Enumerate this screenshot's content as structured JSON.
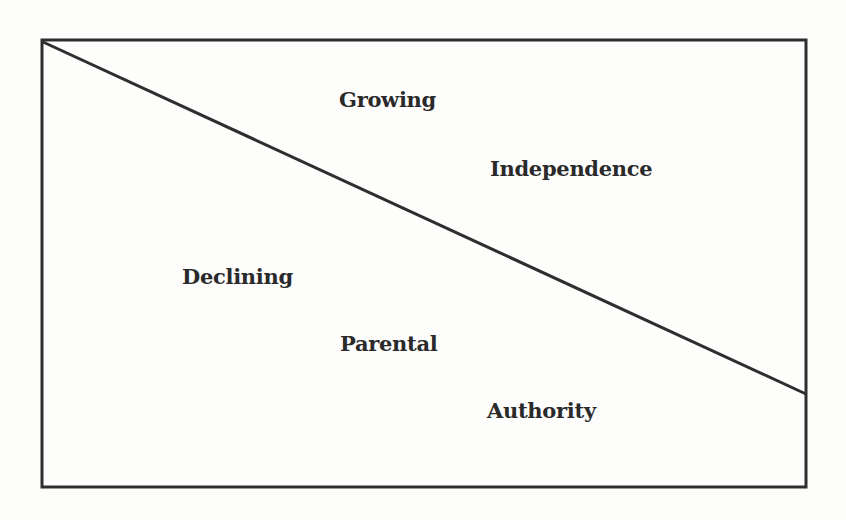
{
  "diagram": {
    "type": "divided-rectangle",
    "colors": {
      "stroke": "#2e2e2e",
      "text": "#2a2a2a",
      "background": "#fdfdfc"
    },
    "upper_region": {
      "lines": [
        "Growing",
        "Independence"
      ]
    },
    "lower_region": {
      "lines": [
        "Declining",
        "Parental",
        "Authority"
      ]
    }
  }
}
